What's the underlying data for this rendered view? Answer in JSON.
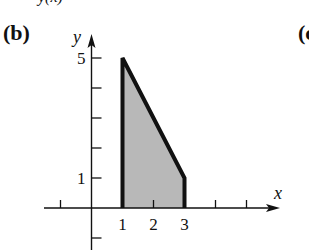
{
  "figure": {
    "top_caption_fragment": "y(x)",
    "panel_label": "(b)",
    "next_panel_label_fragment": "(c"
  },
  "chart_data": {
    "type": "area",
    "title": "",
    "xlabel": "x",
    "ylabel": "y",
    "xlim": [
      -1.5,
      6
    ],
    "ylim": [
      -1.5,
      5.5
    ],
    "x_ticks": [
      -1,
      1,
      2,
      3,
      4,
      5
    ],
    "x_tick_labels": [
      {
        "value": 1,
        "label": "1"
      },
      {
        "value": 2,
        "label": "2"
      },
      {
        "value": 3,
        "label": "3"
      }
    ],
    "y_ticks": [
      -1,
      1,
      2,
      3,
      4,
      5
    ],
    "y_tick_labels": [
      {
        "value": 5,
        "label": "5"
      },
      {
        "value": 1,
        "label": "1"
      }
    ],
    "grid": false,
    "region": {
      "description": "Shaded region under line from (1,5) to (3,1), bounded by x=1 and x=3",
      "vertices": [
        [
          1,
          0
        ],
        [
          1,
          5
        ],
        [
          3,
          1
        ],
        [
          3,
          0
        ]
      ],
      "fill_color": "#b8b8b8",
      "edge_color": "#111111"
    }
  }
}
